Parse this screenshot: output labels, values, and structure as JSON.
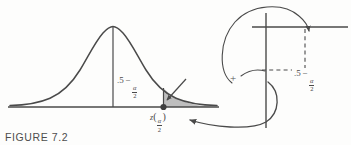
{
  "figure": {
    "caption": "FIGURE 7.2",
    "background_color": "#fdfdfc",
    "line_color": "#4a4a4a",
    "shade_color": "#b4b4b4"
  },
  "normal_curve": {
    "name": "standard-normal-curve",
    "center_label": {
      "lead": ".5",
      "operator": "−",
      "numerator": "α",
      "denominator": "2"
    },
    "axis_tick_label": {
      "variable": "z",
      "open_paren": "(",
      "numerator": "α",
      "denominator": "2",
      "close_paren": ")"
    },
    "shaded_region": "upper-tail-alpha-over-two"
  },
  "operator": {
    "symbol": "+"
  },
  "table_inset": {
    "name": "z-table-inset",
    "value_label": {
      "lead": ".5",
      "operator": "−",
      "numerator": "α",
      "denominator": "2"
    }
  }
}
